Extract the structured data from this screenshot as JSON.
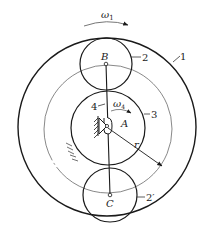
{
  "diagram": {
    "type": "planetary gear train (mechanism schematic)",
    "colors": {
      "stroke": "#1a1a1a",
      "thin_stroke": "#555555",
      "background": "#ffffff"
    },
    "labels": {
      "omega1": "ω",
      "omega1_sub": "1",
      "omega4": "ω",
      "omega4_sub": "4",
      "point_B": "B",
      "point_A": "A",
      "point_C": "C",
      "part_1": "1",
      "part_2": "2",
      "part_2prime": "2′",
      "part_3": "3",
      "part_4": "4",
      "radius": "r"
    },
    "components": [
      {
        "id": "1",
        "name": "outer ring gear"
      },
      {
        "id": "2",
        "name": "planet gear at B"
      },
      {
        "id": "2′",
        "name": "planet gear at C"
      },
      {
        "id": "3",
        "name": "sun gear centered at A"
      },
      {
        "id": "4",
        "name": "carrier arm B–C"
      }
    ]
  }
}
